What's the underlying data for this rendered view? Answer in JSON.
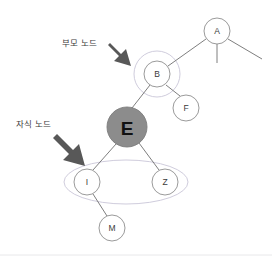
{
  "diagram": {
    "type": "tree-diagram",
    "background_color": "#ffffff",
    "annotations": [
      {
        "id": "parent-node-annotation",
        "label": "부모 노드",
        "arrow": "down-right-arrow",
        "points_to": "B",
        "text_x": 62,
        "text_y": 41,
        "arrow_from_x": 110,
        "arrow_from_y": 43,
        "arrow_to_x": 142,
        "arrow_to_y": 68
      },
      {
        "id": "child-node-annotation",
        "label": "자식 노드",
        "arrow": "down-right-arrow",
        "points_to": "I",
        "text_x": 16,
        "text_y": 121,
        "arrow_from_x": 55,
        "arrow_from_y": 133,
        "arrow_to_x": 87,
        "arrow_to_y": 167
      }
    ],
    "nodes": [
      {
        "id": "A",
        "label": "A",
        "cx": 217,
        "cy": 31,
        "r": 13,
        "fill": "#ffffff",
        "stroke": "#8f8f8f",
        "label_size": "small"
      },
      {
        "id": "B",
        "label": "B",
        "cx": 157,
        "cy": 74,
        "r": 13,
        "fill": "#ffffff",
        "stroke": "#8f8f8f",
        "label_size": "small"
      },
      {
        "id": "F",
        "label": "F",
        "cx": 186,
        "cy": 108,
        "r": 13,
        "fill": "#ffffff",
        "stroke": "#8f8f8f",
        "label_size": "small"
      },
      {
        "id": "E",
        "label": "E",
        "cx": 127,
        "cy": 127,
        "r": 20,
        "fill": "#8c8c8c",
        "stroke": "#7d7d7d",
        "label_size": "big"
      },
      {
        "id": "I",
        "label": "I",
        "cx": 87,
        "cy": 182,
        "r": 13,
        "fill": "#ffffff",
        "stroke": "#8f8f8f",
        "label_size": "small"
      },
      {
        "id": "Z",
        "label": "Z",
        "cx": 165,
        "cy": 182,
        "r": 13,
        "fill": "#ffffff",
        "stroke": "#8f8f8f",
        "label_size": "small"
      },
      {
        "id": "M",
        "label": "M",
        "cx": 112,
        "cy": 228,
        "r": 13,
        "fill": "#ffffff",
        "stroke": "#8f8f8f",
        "label_size": "small"
      }
    ],
    "edges": [
      {
        "id": "edge-A-B",
        "from": "A",
        "to": "B"
      },
      {
        "id": "edge-A-stub-middle",
        "from": "A",
        "to": "stub-middle"
      },
      {
        "id": "edge-A-stub-right",
        "from": "A",
        "to": "stub-right"
      },
      {
        "id": "edge-B-E",
        "from": "B",
        "to": "E"
      },
      {
        "id": "edge-B-F",
        "from": "B",
        "to": "F"
      },
      {
        "id": "edge-E-I",
        "from": "E",
        "to": "I"
      },
      {
        "id": "edge-E-Z",
        "from": "E",
        "to": "Z"
      },
      {
        "id": "edge-I-M",
        "from": "I",
        "to": "M"
      }
    ],
    "highlights": [
      {
        "id": "parent-highlight-circle",
        "shape": "circle",
        "cx": 157,
        "cy": 74,
        "r": 23,
        "stroke": "#c9c6d8"
      },
      {
        "id": "child-highlight-ellipse",
        "shape": "ellipse",
        "cx": 126,
        "cy": 182,
        "rx": 62,
        "ry": 22,
        "stroke": "#c9c6d8"
      }
    ],
    "edge_color": "#6f6f6f",
    "arrow_color": "#555555",
    "footer_rule_color": "#e8e8ea"
  }
}
